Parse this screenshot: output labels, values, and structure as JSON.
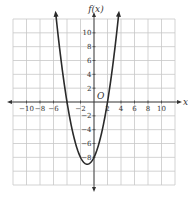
{
  "chart_data": {
    "type": "line",
    "title": "",
    "xlabel": "x",
    "ylabel": "f(x)",
    "origin_label": "O",
    "xlim": [
      -12,
      12
    ],
    "ylim": [
      -12,
      12
    ],
    "grid": true,
    "grid_step": 2,
    "x_ticks": [
      -10,
      -8,
      -6,
      -4,
      -2,
      2,
      4,
      6,
      8,
      10
    ],
    "x_tick_labels": [
      "−10",
      "−8",
      "−6",
      "",
      "−2",
      "2",
      "4",
      "6",
      "8",
      "10"
    ],
    "y_ticks": [
      -8,
      -6,
      -4,
      -2,
      2,
      4,
      6,
      8,
      10
    ],
    "y_tick_labels": [
      "−8",
      "−6",
      "−4",
      "−2",
      "2",
      "4",
      "6",
      "8",
      "10"
    ],
    "series": [
      {
        "name": "f(x) = x^2 + 2x - 8",
        "coefficients": [
          1,
          2,
          -8
        ],
        "x_range": [
          -5.65,
          3.65
        ],
        "vertex": [
          -1,
          -9
        ],
        "roots": [
          -4,
          2
        ],
        "color": "#2a2a2a"
      }
    ]
  }
}
